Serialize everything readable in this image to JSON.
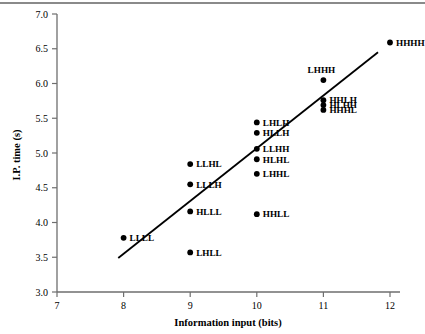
{
  "chart_data": {
    "type": "scatter",
    "title": "",
    "xlabel": "Information input (bits)",
    "ylabel": "I.P. time (s)",
    "xlim": [
      7,
      12
    ],
    "ylim": [
      3.0,
      7.0
    ],
    "xticks": [
      "7",
      "8",
      "9",
      "10",
      "11",
      "12"
    ],
    "yticks": [
      "3.0",
      "3.5",
      "4.0",
      "4.5",
      "5.0",
      "5.5",
      "6.0",
      "6.5",
      "7.0"
    ],
    "grid": false,
    "legend": "none",
    "point_color": "#000000",
    "line_color": "#000000",
    "points": [
      {
        "label": "LLLL",
        "x": 8,
        "y": 3.78,
        "label_pos": "right"
      },
      {
        "label": "LLHL",
        "x": 9,
        "y": 4.84,
        "label_pos": "right"
      },
      {
        "label": "LLLH",
        "x": 9,
        "y": 4.55,
        "label_pos": "right"
      },
      {
        "label": "HLLL",
        "x": 9,
        "y": 4.16,
        "label_pos": "right"
      },
      {
        "label": "LHLL",
        "x": 9,
        "y": 3.57,
        "label_pos": "right"
      },
      {
        "label": "LHLH",
        "x": 10,
        "y": 5.44,
        "label_pos": "right"
      },
      {
        "label": "HLLH",
        "x": 10,
        "y": 5.29,
        "label_pos": "right"
      },
      {
        "label": "LLHH",
        "x": 10,
        "y": 5.06,
        "label_pos": "right"
      },
      {
        "label": "HLHL",
        "x": 10,
        "y": 4.91,
        "label_pos": "right"
      },
      {
        "label": "LHHL",
        "x": 10,
        "y": 4.7,
        "label_pos": "right"
      },
      {
        "label": "HHLL",
        "x": 10,
        "y": 4.12,
        "label_pos": "right"
      },
      {
        "label": "LHHH",
        "x": 11,
        "y": 6.05,
        "label_pos": "above"
      },
      {
        "label": "HHLH",
        "x": 11,
        "y": 5.76,
        "label_pos": "right"
      },
      {
        "label": "HLHH",
        "x": 11,
        "y": 5.69,
        "label_pos": "right"
      },
      {
        "label": "HHHL",
        "x": 11,
        "y": 5.62,
        "label_pos": "right"
      },
      {
        "label": "HHHH",
        "x": 12,
        "y": 6.59,
        "label_pos": "right"
      }
    ],
    "fit_line": {
      "x_start": 7.92,
      "y_start": 3.49,
      "x_end": 11.82,
      "y_end": 6.45
    }
  }
}
